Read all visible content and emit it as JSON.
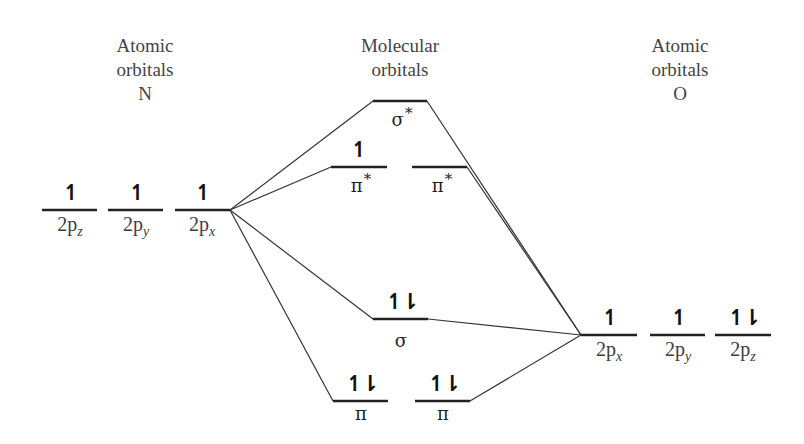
{
  "headings": {
    "left": [
      "Atomic",
      "orbitals",
      "N"
    ],
    "center": [
      "Molecular",
      "orbitals"
    ],
    "right": [
      "Atomic",
      "orbitals",
      "O"
    ]
  },
  "atom_N": {
    "orbitals": [
      {
        "name": "2p",
        "sub": "z",
        "electrons": "↿"
      },
      {
        "name": "2p",
        "sub": "y",
        "electrons": "↿"
      },
      {
        "name": "2p",
        "sub": "x",
        "electrons": "↿"
      }
    ]
  },
  "atom_O": {
    "orbitals": [
      {
        "name": "2p",
        "sub": "x",
        "electrons": "↿"
      },
      {
        "name": "2p",
        "sub": "y",
        "electrons": "↿"
      },
      {
        "name": "2p",
        "sub": "z",
        "electrons": "↿⇂"
      }
    ]
  },
  "molecular": {
    "sigma_star": {
      "symbol": "σ",
      "star": "*",
      "electrons": ""
    },
    "pi_star_1": {
      "symbol": "π",
      "star": "*",
      "electrons": "↿"
    },
    "pi_star_2": {
      "symbol": "π",
      "star": "*",
      "electrons": ""
    },
    "sigma": {
      "symbol": "σ",
      "electrons": "↿⇂"
    },
    "pi_1": {
      "symbol": "π",
      "electrons": "↿⇂"
    },
    "pi_2": {
      "symbol": "π",
      "electrons": "↿⇂"
    }
  },
  "colors": {
    "level_line": "#222222",
    "connector_line": "#333333",
    "text": "#3d3d3d"
  }
}
